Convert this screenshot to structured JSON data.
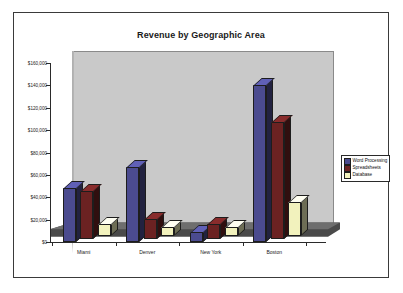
{
  "chart_data": {
    "type": "bar",
    "title": "Revenue by Geographic Area",
    "xlabel": "",
    "ylabel": "",
    "categories": [
      "Miami",
      "Denver",
      "New York",
      "Boston"
    ],
    "series": [
      {
        "name": "Word Processing",
        "color": "#4b4b8f",
        "values": [
          48000,
          67000,
          9000,
          140000
        ]
      },
      {
        "name": "Spreadsheets",
        "color": "#6b2222",
        "values": [
          43000,
          18000,
          13000,
          105000
        ]
      },
      {
        "name": "Database",
        "color": "#f2f2bd",
        "values": [
          11000,
          8000,
          8000,
          30000
        ]
      }
    ],
    "ylim": [
      0,
      160000
    ],
    "ytick_values": [
      0,
      20000,
      40000,
      60000,
      80000,
      100000,
      120000,
      140000,
      160000
    ],
    "ytick_labels": [
      "$0",
      "$20,000",
      "$40,000",
      "$60,000",
      "$80,000",
      "$100,000",
      "$120,000",
      "$140,000",
      "$160,000"
    ],
    "grid": false,
    "legend_position": "right",
    "style": "3d-column",
    "plot_background": "#c9c9c9",
    "frame_background": "#ffffff",
    "frame_border_color": "#3a3a3a",
    "floor_color": "#4a4a4a"
  },
  "legend": {
    "items": [
      {
        "label": "Word Processing",
        "color": "#4b4b8f"
      },
      {
        "label": "Spreadsheets",
        "color": "#6b2222"
      },
      {
        "label": "Database",
        "color": "#f2f2bd"
      }
    ]
  }
}
